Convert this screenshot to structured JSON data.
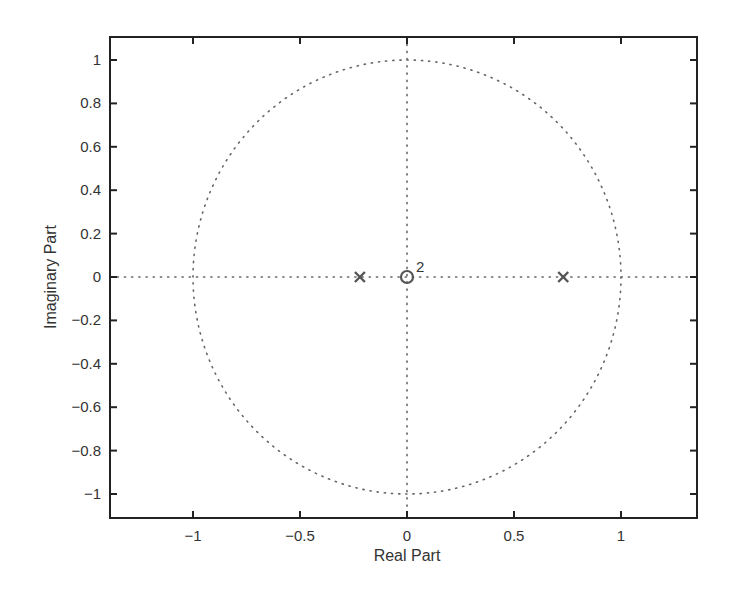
{
  "chart_data": {
    "type": "scatter",
    "title": "",
    "subtitle": "Pole-zero plot",
    "xlabel": "Real Part",
    "ylabel": "Imaginary Part",
    "xlim": [
      -1.4,
      1.4
    ],
    "ylim": [
      -1.1,
      1.1
    ],
    "grid": false,
    "legend": null,
    "x_ticks": [
      -1,
      -0.5,
      0,
      0.5,
      1
    ],
    "x_tick_labels": [
      "−1",
      "−0.5",
      "0",
      "0.5",
      "1"
    ],
    "y_ticks": [
      1,
      0.8,
      0.6,
      0.4,
      0.2,
      0,
      -0.2,
      -0.4,
      -0.6,
      -0.8,
      -1
    ],
    "y_tick_labels": [
      "1",
      "0.8",
      "0.6",
      "0.4",
      "0.2",
      "0",
      "−0.2",
      "−0.4",
      "−0.6",
      "−0.8",
      "−1"
    ],
    "series": [
      {
        "name": "poles",
        "marker": "x",
        "points": [
          {
            "re": -0.22,
            "im": 0
          },
          {
            "re": 0.73,
            "im": 0
          }
        ]
      },
      {
        "name": "zeros",
        "marker": "o",
        "points": [
          {
            "re": 0,
            "im": 0,
            "multiplicity": 2
          }
        ]
      }
    ],
    "annotations": [
      {
        "text": "2",
        "at": {
          "re": 0,
          "im": 0
        },
        "meaning": "zero multiplicity"
      }
    ],
    "reference_lines": [
      "unit circle (dotted)",
      "real axis (dotted)",
      "imaginary axis (dotted)"
    ]
  },
  "labels": {
    "xlabel": "Real Part",
    "ylabel": "Imaginary Part",
    "multiplicity": "2"
  },
  "colors": {
    "axes": "#222222",
    "markers": "#555555",
    "dotted": "#666666"
  }
}
